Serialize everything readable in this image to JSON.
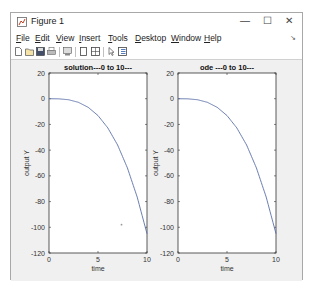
{
  "window": {
    "title": "Figure 1",
    "controls": {
      "minimize": "—",
      "maximize": "☐",
      "close": "✕"
    }
  },
  "menubar": {
    "items": [
      {
        "label": "File",
        "mnemonic": "F"
      },
      {
        "label": "Edit",
        "mnemonic": "E"
      },
      {
        "label": "View",
        "mnemonic": "V"
      },
      {
        "label": "Insert",
        "mnemonic": "I"
      },
      {
        "label": "Tools",
        "mnemonic": "T"
      },
      {
        "label": "Desktop",
        "mnemonic": "D"
      },
      {
        "label": "Window",
        "mnemonic": "W"
      },
      {
        "label": "Help",
        "mnemonic": "H"
      }
    ],
    "overflow_icon": "dock-arrow-icon"
  },
  "toolbar": {
    "icons": [
      "new-figure-icon",
      "open-file-icon",
      "save-icon",
      "print-icon",
      "zoom-icon",
      "hide-plot-tools-icon",
      "show-plot-tools-icon",
      "edit-plot-pointer-icon",
      "insert-legend-icon"
    ]
  },
  "chart_data": [
    {
      "type": "line",
      "title": "solution---0 to 10---",
      "xlabel": "time",
      "ylabel": "output Y",
      "xlim": [
        0,
        10
      ],
      "ylim": [
        -120,
        20
      ],
      "xticks": [
        "0",
        "5",
        "10"
      ],
      "yticks": [
        "20",
        "0",
        "-20",
        "-40",
        "-60",
        "-80",
        "-100",
        "-120"
      ],
      "grid": false,
      "series": [
        {
          "name": "solution",
          "color": "#5a6fa8",
          "x": [
            0,
            1,
            2,
            3,
            4,
            5,
            6,
            7,
            8,
            9,
            10
          ],
          "y": [
            0,
            -0.1,
            -0.8,
            -2.8,
            -6.7,
            -13.1,
            -22.7,
            -36.0,
            -53.8,
            -76.5,
            -105
          ]
        }
      ],
      "annotations": [
        {
          "type": "stray-point",
          "x": 7.4,
          "y": -98
        }
      ]
    },
    {
      "type": "line",
      "title": "ode ---0 to 10---",
      "xlabel": "time",
      "ylabel": "output Y",
      "xlim": [
        0,
        10
      ],
      "ylim": [
        -120,
        20
      ],
      "xticks": [
        "0",
        "5",
        "10"
      ],
      "yticks": [
        "20",
        "0",
        "-20",
        "-40",
        "-60",
        "-80",
        "-100",
        "-120"
      ],
      "grid": false,
      "series": [
        {
          "name": "ode",
          "color": "#5a6fa8",
          "x": [
            0,
            1,
            2,
            3,
            4,
            5,
            6,
            7,
            8,
            9,
            10
          ],
          "y": [
            0,
            -0.1,
            -0.8,
            -2.8,
            -6.7,
            -13.1,
            -22.7,
            -36.0,
            -53.8,
            -76.5,
            -105
          ]
        }
      ]
    }
  ]
}
